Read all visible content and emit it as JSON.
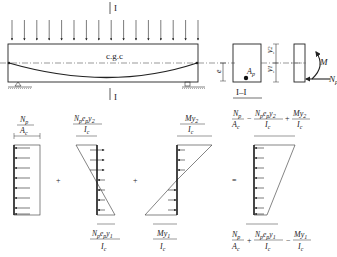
{
  "section_marker": {
    "top": "I",
    "bottom": "I",
    "section_label": "I–I"
  },
  "beam": {
    "cgc_label": "c.g.c",
    "load_arrow_count": 16
  },
  "section": {
    "ep_label": "e",
    "ep_sub": "p",
    "ap_label": "A",
    "ap_sub": "p",
    "y1_label": "y",
    "y1_sub": "1",
    "y2_label": "y",
    "y2_sub": "2"
  },
  "forces": {
    "moment_label": "M",
    "axial_label": "N",
    "axial_sub": "p"
  },
  "operators": {
    "plus1": "+",
    "plus2": "+",
    "equals": "="
  },
  "diagrams": {
    "d1": {
      "num": "N",
      "num_sub": "p",
      "den": "A",
      "den_sub": "c"
    },
    "d2": {
      "top_num": "N",
      "top_num_sub": "p",
      "top_num_e": "e",
      "top_num_e_sub": "p",
      "top_num_y": "y",
      "top_num_y_sub": "2",
      "top_den": "I",
      "top_den_sub": "c",
      "bot_num_y_sub": "1"
    },
    "d3": {
      "top_num": "My",
      "top_num_sub": "2",
      "top_den": "I",
      "top_den_sub": "c",
      "bot_num": "My",
      "bot_num_sub": "1"
    },
    "result": {
      "top_signs": [
        "−",
        "+"
      ],
      "bot_signs": [
        "+",
        "−"
      ]
    }
  }
}
